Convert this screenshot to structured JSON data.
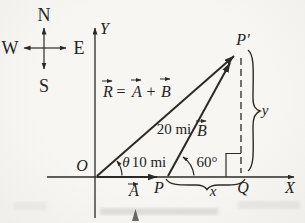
{
  "colors": {
    "ink": "#2b2a27",
    "paper": "#f6f5f2"
  },
  "compass": {
    "n": "N",
    "s": "S",
    "e": "E",
    "w": "W"
  },
  "axes": {
    "x_label": "X",
    "y_label": "Y",
    "origin_label": "O"
  },
  "equation": {
    "r": "R",
    "equals": "=",
    "a": "A",
    "plus": "+",
    "b": "B"
  },
  "vectors": {
    "r_magnitude": "20 mi",
    "a_magnitude": "10 mi",
    "a_symbol": "A",
    "b_symbol": "B"
  },
  "angles": {
    "theta": "θ",
    "at_p": "60°"
  },
  "points": {
    "p_prime": "P′",
    "p": "P",
    "q": "Q"
  },
  "components": {
    "x": "x",
    "y": "y"
  }
}
